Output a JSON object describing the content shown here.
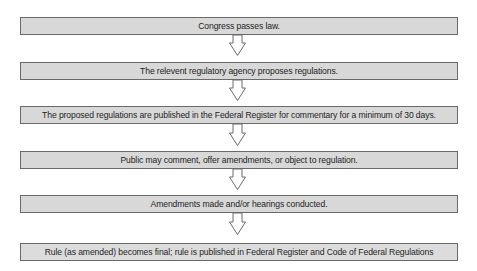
{
  "diagram": {
    "type": "flowchart",
    "direction": "top-to-bottom",
    "colors": {
      "box_fill": "#d8d8d8",
      "box_border": "#6a6a6a",
      "text": "#1e1e1e",
      "arrow_fill": "#ffffff",
      "arrow_stroke": "#6a6a6a",
      "background": "#ffffff"
    },
    "steps": [
      {
        "label": "Congress passes law."
      },
      {
        "label": "The relevent regulatory agency proposes regulations."
      },
      {
        "label": "The proposed regulations are published in the Federal Register for commentary for a minimum of 30 days."
      },
      {
        "label": "Public may comment, offer amendments, or object to regulation."
      },
      {
        "label": "Amendments made and/or hearings conducted."
      },
      {
        "label": "Rule (as amended) becomes final;  rule is published in Federal Register and Code of Federal Regulations"
      }
    ],
    "arrows": [
      {
        "from": 0,
        "to": 1,
        "icon": "down-arrow-icon"
      },
      {
        "from": 1,
        "to": 2,
        "icon": "down-arrow-icon"
      },
      {
        "from": 2,
        "to": 3,
        "icon": "down-arrow-icon"
      },
      {
        "from": 3,
        "to": 4,
        "icon": "down-arrow-icon"
      },
      {
        "from": 4,
        "to": 5,
        "icon": "down-arrow-icon"
      }
    ]
  }
}
